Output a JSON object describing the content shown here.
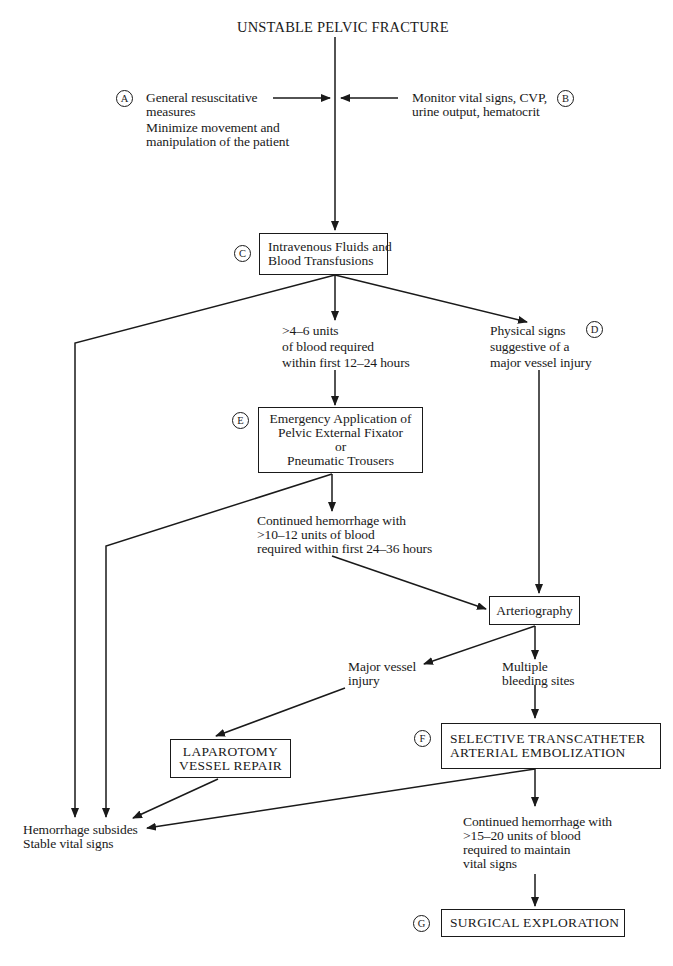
{
  "title": "UNSTABLE PELVIC FRACTURE",
  "steps": {
    "A": {
      "marker": "A",
      "lines": [
        "General resuscitative",
        "measures",
        "Minimize movement and",
        "manipulation of the patient"
      ]
    },
    "B": {
      "marker": "B",
      "lines": [
        "Monitor vital signs, CVP,",
        "urine output, hematocrit"
      ]
    },
    "C": {
      "marker": "C",
      "lines": [
        "Intravenous Fluids and",
        "Blood Transfusions"
      ]
    },
    "D": {
      "marker": "D",
      "lines": [
        "Physical signs",
        "suggestive of a",
        "major vessel injury"
      ]
    },
    "E": {
      "marker": "E",
      "lines": [
        "Emergency Application of",
        "Pelvic External Fixator",
        "or",
        "Pneumatic Trousers"
      ]
    },
    "F": {
      "marker": "F",
      "lines": [
        "SELECTIVE TRANSCATHETER",
        "ARTERIAL EMBOLIZATION"
      ]
    },
    "G": {
      "marker": "G",
      "lines": [
        "SURGICAL EXPLORATION"
      ]
    }
  },
  "conditions": {
    "blood_4_6": [
      ">4–6 units",
      "of blood required",
      "within first 12–24 hours"
    ],
    "blood_10_12": [
      "Continued hemorrhage with",
      ">10–12 units of blood",
      "required within first 24–36 hours"
    ],
    "major_vessel": [
      "Major vessel",
      "injury"
    ],
    "multiple_sites": [
      "Multiple",
      "bleeding sites"
    ],
    "blood_15_20": [
      "Continued hemorrhage with",
      ">15–20 units of blood",
      "required to maintain",
      "vital signs"
    ]
  },
  "nodes": {
    "arteriography": "Arteriography",
    "laparotomy": [
      "LAPAROTOMY",
      "VESSEL REPAIR"
    ],
    "outcome": [
      "Hemorrhage subsides",
      "Stable vital signs"
    ]
  },
  "colors": {
    "ink": "#1a1a1a",
    "background": "#ffffff"
  }
}
